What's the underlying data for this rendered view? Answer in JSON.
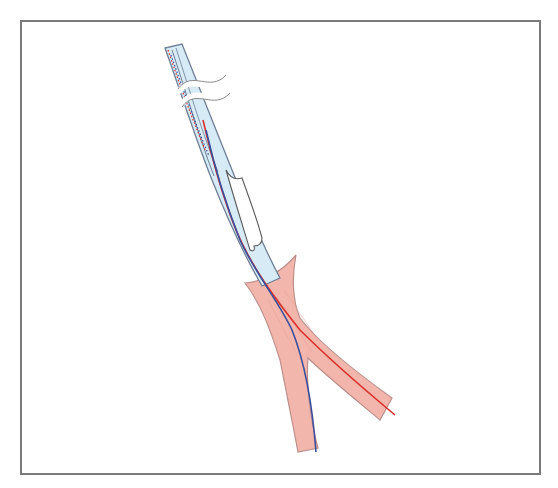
{
  "figure": {
    "colors": {
      "frame": "#7a7a7a",
      "sheath_fill": "#d6ebf5",
      "sheath_stroke": "#6f7f96",
      "balloon_fill": "#ffffff",
      "balloon_stroke": "#5a5a5a",
      "vessel_fill": "#f2b3a8",
      "vessel_stroke": "#b98a86",
      "wire_blue": "#3d4f9a",
      "wire_red": "#d8312b",
      "break_mark": "#ffffff"
    },
    "elements": [
      {
        "name": "sheath",
        "label": ""
      },
      {
        "name": "balloon",
        "label": ""
      },
      {
        "name": "vessel-bifurcation",
        "label": ""
      },
      {
        "name": "guidewire-blue",
        "label": ""
      },
      {
        "name": "guidewire-red",
        "label": ""
      },
      {
        "name": "break-marks",
        "label": ""
      }
    ]
  }
}
